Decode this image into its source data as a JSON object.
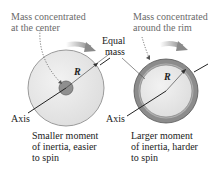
{
  "left": {
    "top_label_line1": "Mass concentrated",
    "top_label_line2": "at the center",
    "radius_label": "R",
    "axis_label": "Axis",
    "caption_line1": "Smaller moment",
    "caption_line2": "of inertia, easier",
    "caption_line3": "to spin"
  },
  "middle": {
    "equal_line1": "Equal",
    "equal_line2": "mass"
  },
  "right": {
    "top_label_line1": "Mass concentrated",
    "top_label_line2": "around the rim",
    "radius_label": "R",
    "axis_label": "Axis",
    "caption_line1": "Larger moment",
    "caption_line2": "of inertia, harder",
    "caption_line3": "to spin"
  },
  "colors": {
    "disk_fill": "#e6e6e6",
    "rim": "#8c8c8c",
    "hub": "#8f8f8f",
    "arrow": "#9a9a9a",
    "label_gray": "#6a6a6a"
  }
}
